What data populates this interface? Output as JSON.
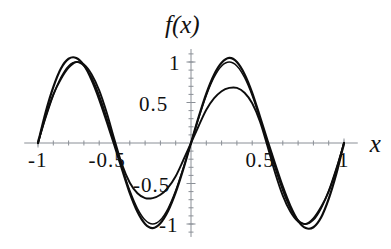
{
  "chart_data": {
    "type": "line",
    "title": "",
    "xlabel": "x",
    "ylabel": "f(x)",
    "xlim": [
      -1.09,
      1.09
    ],
    "ylim": [
      -1.18,
      1.18
    ],
    "grid": false,
    "legend": null,
    "x_ticks": [
      {
        "value": -1,
        "label": "-1"
      },
      {
        "value": -0.5,
        "label": "-0.5"
      },
      {
        "value": 0.5,
        "label": "0.5"
      },
      {
        "value": 1,
        "label": "1"
      }
    ],
    "y_ticks": [
      {
        "value": 1,
        "label": "1"
      },
      {
        "value": 0.5,
        "label": "0.5"
      },
      {
        "value": -0.5,
        "label": "-0.5"
      },
      {
        "value": -1,
        "label": "-1"
      }
    ],
    "minor_tick_step": 0.1,
    "series": [
      {
        "name": "sine-reference",
        "amplitude": 1.0,
        "period": 1.0,
        "stroke": "#0d0d0d",
        "x": [
          -1,
          -0.95,
          -0.9,
          -0.85,
          -0.8,
          -0.75,
          -0.7,
          -0.65,
          -0.6,
          -0.55,
          -0.5,
          -0.45,
          -0.4,
          -0.35,
          -0.3,
          -0.25,
          -0.2,
          -0.15,
          -0.1,
          -0.05,
          0,
          0.05,
          0.1,
          0.15,
          0.2,
          0.25,
          0.3,
          0.35,
          0.4,
          0.45,
          0.5,
          0.55,
          0.6,
          0.65,
          0.7,
          0.75,
          0.8,
          0.85,
          0.9,
          0.95,
          1
        ],
        "values": [
          0,
          0.309,
          0.588,
          0.809,
          0.951,
          1,
          0.951,
          0.809,
          0.588,
          0.309,
          0,
          -0.309,
          -0.588,
          -0.809,
          -0.951,
          -1,
          -0.951,
          -0.809,
          -0.588,
          -0.309,
          0,
          0.309,
          0.588,
          0.809,
          0.951,
          1,
          0.951,
          0.809,
          0.588,
          0.309,
          0,
          -0.309,
          -0.588,
          -0.809,
          -0.951,
          -1,
          -0.951,
          -0.809,
          -0.588,
          -0.309,
          0
        ]
      },
      {
        "name": "approximation-high",
        "amplitude": 1.05,
        "period": 1.0,
        "phase_shift": 0.02,
        "stroke": "#0d0d0d",
        "x": [
          -1,
          -0.95,
          -0.9,
          -0.85,
          -0.8,
          -0.75,
          -0.7,
          -0.65,
          -0.6,
          -0.55,
          -0.5,
          -0.45,
          -0.4,
          -0.35,
          -0.3,
          -0.25,
          -0.2,
          -0.15,
          -0.1,
          -0.05,
          0,
          0.05,
          0.1,
          0.15,
          0.2,
          0.25,
          0.3,
          0.35,
          0.4,
          0.45,
          0.5,
          0.55,
          0.6,
          0.65,
          0.7,
          0.75,
          0.8,
          0.85,
          0.9,
          0.95,
          1
        ],
        "values": [
          0,
          0.38,
          0.69,
          0.92,
          1.04,
          1.05,
          0.96,
          0.78,
          0.54,
          0.26,
          -0.03,
          -0.33,
          -0.62,
          -0.85,
          -1,
          -1.05,
          -0.99,
          -0.84,
          -0.61,
          -0.32,
          0,
          0.32,
          0.61,
          0.84,
          0.99,
          1.05,
          1,
          0.85,
          0.62,
          0.33,
          0.03,
          -0.26,
          -0.54,
          -0.78,
          -0.96,
          -1.05,
          -1.04,
          -0.92,
          -0.69,
          -0.38,
          0
        ]
      },
      {
        "name": "approximation-low",
        "amplitude": 0.68,
        "period": 1.0,
        "stroke": "#0d0d0d",
        "x": [
          -1,
          -0.95,
          -0.9,
          -0.85,
          -0.8,
          -0.75,
          -0.7,
          -0.65,
          -0.6,
          -0.55,
          -0.5,
          -0.45,
          -0.4,
          -0.35,
          -0.3,
          -0.25,
          -0.2,
          -0.15,
          -0.1,
          -0.05,
          0,
          0.05,
          0.1,
          0.15,
          0.2,
          0.25,
          0.3,
          0.35,
          0.4,
          0.45,
          0.5,
          0.55,
          0.6,
          0.65,
          0.7,
          0.75,
          0.8,
          0.85,
          0.9,
          0.95,
          1
        ],
        "values": [
          0,
          0.33,
          0.6,
          0.79,
          0.93,
          1.0,
          0.97,
          0.85,
          0.65,
          0.37,
          0.04,
          -0.27,
          -0.49,
          -0.62,
          -0.68,
          -0.68,
          -0.64,
          -0.55,
          -0.41,
          -0.21,
          0,
          0.21,
          0.41,
          0.55,
          0.64,
          0.68,
          0.68,
          0.62,
          0.49,
          0.27,
          -0.04,
          -0.37,
          -0.65,
          -0.85,
          -0.97,
          -1.0,
          -0.93,
          -0.79,
          -0.6,
          -0.33,
          0
        ]
      }
    ]
  }
}
